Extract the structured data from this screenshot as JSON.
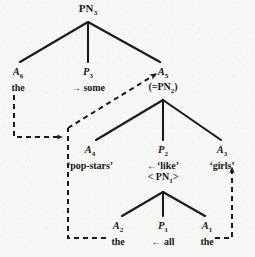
{
  "figure": {
    "type": "dependency-tree",
    "title_visible": false,
    "background_color": "#f7f7f5",
    "ink_color": "#1a1a1a"
  },
  "nodes": [
    {
      "id": "PN3",
      "label": "PN",
      "sub": "3",
      "gloss": "",
      "extra": "",
      "extra_sub": "",
      "x": 88,
      "y": 2
    },
    {
      "id": "A6",
      "label": "A",
      "sub": "6",
      "gloss": "the",
      "extra": "",
      "extra_sub": "",
      "x": 18,
      "y": 68
    },
    {
      "id": "P3",
      "label": "P",
      "sub": "3",
      "gloss": "→ some",
      "extra": "",
      "extra_sub": "",
      "x": 88,
      "y": 68
    },
    {
      "id": "A5",
      "label": "A",
      "sub": "5",
      "gloss": "(=PN",
      "extra": "",
      "extra_sub": "2",
      "x": 163,
      "y": 68
    },
    {
      "id": "A4",
      "label": "A",
      "sub": "4",
      "gloss": "‘pop-stars’",
      "extra": "",
      "extra_sub": "",
      "x": 90,
      "y": 146
    },
    {
      "id": "P2",
      "label": "P",
      "sub": "2",
      "gloss": "←‘like’",
      "extra": "< PN",
      "extra_sub": "1",
      "x": 163,
      "y": 146
    },
    {
      "id": "A3",
      "label": "A",
      "sub": "3",
      "gloss": "‘girls’",
      "extra": "",
      "extra_sub": "",
      "x": 222,
      "y": 146
    },
    {
      "id": "A2",
      "label": "A",
      "sub": "2",
      "gloss": "the",
      "extra": "",
      "extra_sub": "",
      "x": 118,
      "y": 222
    },
    {
      "id": "P1",
      "label": "P",
      "sub": "1",
      "gloss": "← all",
      "extra": "",
      "extra_sub": "",
      "x": 163,
      "y": 222
    },
    {
      "id": "A1",
      "label": "A",
      "sub": "1",
      "gloss": "the",
      "extra": "",
      "extra_sub": "",
      "x": 207,
      "y": 222
    }
  ],
  "node_text": {
    "PN3": {
      "label": "PN",
      "sub": "3"
    },
    "A6": {
      "label": "A",
      "sub": "6",
      "gloss": "the"
    },
    "P3": {
      "label": "P",
      "sub": "3",
      "gloss": "some",
      "arrow": "→"
    },
    "A5": {
      "label": "A",
      "sub": "5",
      "extra_open": "(=PN",
      "extra_sub": "2",
      "extra_close": ")"
    },
    "A4": {
      "label": "A",
      "sub": "4",
      "gloss": "‘pop-stars’"
    },
    "P2": {
      "label": "P",
      "sub": "2",
      "gloss": "‘like’",
      "arrow": "←",
      "extra_open": "< PN",
      "extra_sub": "1",
      "extra_close": ">"
    },
    "A3": {
      "label": "A",
      "sub": "3",
      "gloss": "‘girls’"
    },
    "A2": {
      "label": "A",
      "sub": "2",
      "gloss": "the"
    },
    "P1": {
      "label": "P",
      "sub": "1",
      "gloss": "all",
      "arrow": "←"
    },
    "A1": {
      "label": "A",
      "sub": "1",
      "gloss": "the"
    }
  },
  "solid_edges": [
    {
      "from": "PN3",
      "to": "A6"
    },
    {
      "from": "PN3",
      "to": "P3"
    },
    {
      "from": "PN3",
      "to": "A5"
    },
    {
      "from": "A5",
      "to": "A4"
    },
    {
      "from": "A5",
      "to": "P2"
    },
    {
      "from": "A5",
      "to": "A3"
    },
    {
      "from": "P2",
      "to": "A2"
    },
    {
      "from": "P2",
      "to": "P1"
    },
    {
      "from": "P2",
      "to": "A1"
    }
  ],
  "dashed_links": [
    {
      "id": "a6-to-a4",
      "from": "A6",
      "to": "A4",
      "style": "orthogonal",
      "arrowhead": "right"
    },
    {
      "id": "a2-to-a5",
      "from": "A2",
      "to": "A5",
      "style": "orthogonal-then-diagonal",
      "arrowhead": "up-right"
    },
    {
      "id": "a1-to-a3",
      "from": "A1",
      "to": "A3",
      "style": "orthogonal",
      "arrowhead": "up"
    }
  ]
}
